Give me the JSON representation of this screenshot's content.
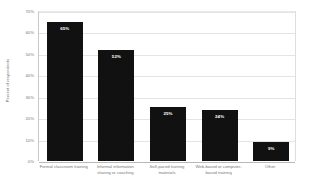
{
  "chart_data": {
    "type": "bar",
    "title": "",
    "xlabel": "",
    "ylabel": "Percent of respondents",
    "categories": [
      "Formal classroom training",
      "Informal information sharing or coaching",
      "Self-paced training materials",
      "Web-based or computer-based training",
      "Other"
    ],
    "values": [
      65,
      52,
      25,
      24,
      9
    ],
    "value_labels": [
      "65%",
      "52%",
      "25%",
      "24%",
      "9%"
    ],
    "ylim": [
      0,
      70
    ],
    "ytick_values": [
      70,
      60,
      50,
      40,
      30,
      20,
      10,
      0
    ],
    "ytick_labels": [
      "70%",
      "60%",
      "50%",
      "40%",
      "30%",
      "20%",
      "10%",
      "0%"
    ],
    "grid": true,
    "legend": false,
    "bar_color": "#111111",
    "value_label_color": "#ffffff",
    "gridline_color": "#e4e4e4",
    "axis_text_color": "#777777"
  }
}
